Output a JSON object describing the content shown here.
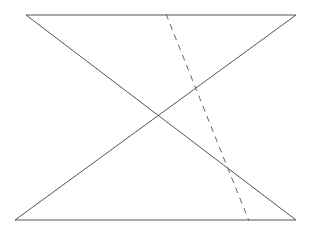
{
  "diagram": {
    "width": 313,
    "height": 232,
    "stroke_color": "#555555",
    "dash_color": "#666666",
    "segments": [
      {
        "name": "top-edge",
        "x1": 26,
        "y1": 15,
        "x2": 296,
        "y2": 15,
        "style": "solid"
      },
      {
        "name": "bottom-edge",
        "x1": 15,
        "y1": 220,
        "x2": 296,
        "y2": 220,
        "style": "solid"
      },
      {
        "name": "diagonal-down",
        "x1": 26,
        "y1": 15,
        "x2": 296,
        "y2": 220,
        "style": "solid"
      },
      {
        "name": "diagonal-up",
        "x1": 296,
        "y1": 15,
        "x2": 15,
        "y2": 220,
        "style": "solid"
      },
      {
        "name": "transversal",
        "x1": 166,
        "y1": 14,
        "x2": 249,
        "y2": 221,
        "style": "dashed"
      }
    ]
  }
}
